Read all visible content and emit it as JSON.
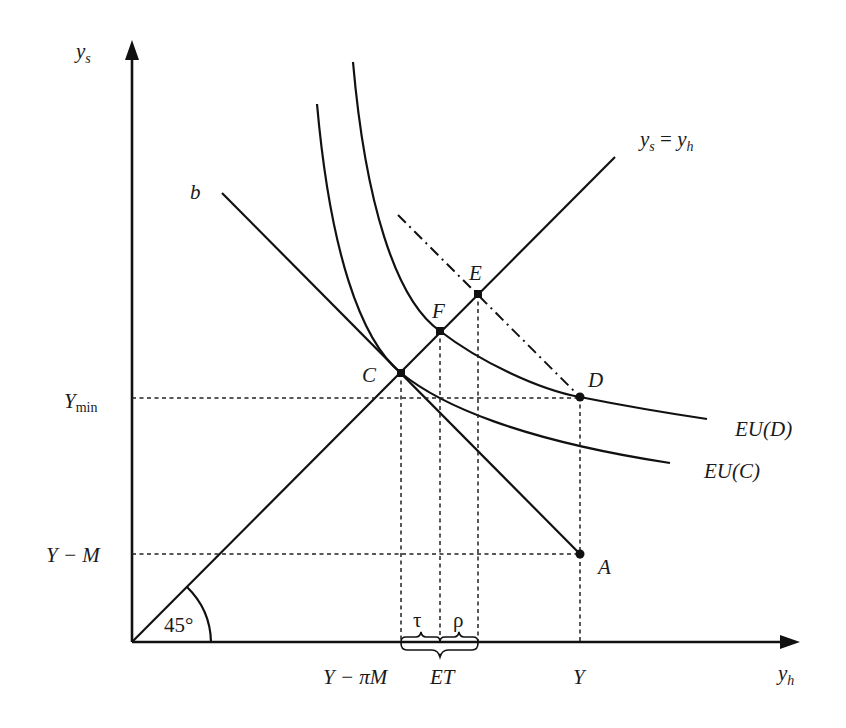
{
  "diagram": {
    "type": "economics-indifference-diagram",
    "axes": {
      "y_label": "y",
      "y_label_sub": "s",
      "x_label": "y",
      "x_label_sub": "h",
      "angle_label": "45°"
    },
    "lines": {
      "certainty_line_label_lhs": "y",
      "certainty_line_label_lhs_sub": "s",
      "certainty_line_label_eq": " = ",
      "certainty_line_label_rhs": "y",
      "certainty_line_label_rhs_sub": "h",
      "budget_line_label": "b"
    },
    "curves": [
      {
        "id": "EU(D)",
        "label": "EU(D)"
      },
      {
        "id": "EU(C)",
        "label": "EU(C)"
      }
    ],
    "points": [
      {
        "id": "A",
        "label": "A"
      },
      {
        "id": "C",
        "label": "C"
      },
      {
        "id": "D",
        "label": "D"
      },
      {
        "id": "E",
        "label": "E"
      },
      {
        "id": "F",
        "label": "F"
      }
    ],
    "y_ticks": {
      "ymin_main": "Y",
      "ymin_sub": "min",
      "y_minus_m": "Y − M"
    },
    "x_ticks": {
      "y_minus_pim": "Y − πM",
      "et": "ET",
      "y": "Y",
      "tau": "τ",
      "rho": "ρ"
    }
  }
}
